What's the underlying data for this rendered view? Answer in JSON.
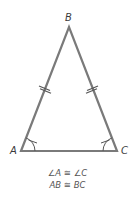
{
  "diagram": {
    "type": "isosceles-triangle",
    "vertices": [
      {
        "label": "A",
        "x": 21,
        "y": 151
      },
      {
        "label": "B",
        "x": 69,
        "y": 27
      },
      {
        "label": "C",
        "x": 117,
        "y": 151
      }
    ],
    "congruent_sides": [
      "AB",
      "BC"
    ],
    "congruent_angles": [
      "A",
      "C"
    ],
    "stroke_color": "#7a7a7a",
    "label_color": "#3a3a3a"
  },
  "labels": {
    "A": "A",
    "B": "B",
    "C": "C"
  },
  "caption": {
    "line1": "∠A ≅ ∠C",
    "line2": "AB ≅ BC"
  }
}
